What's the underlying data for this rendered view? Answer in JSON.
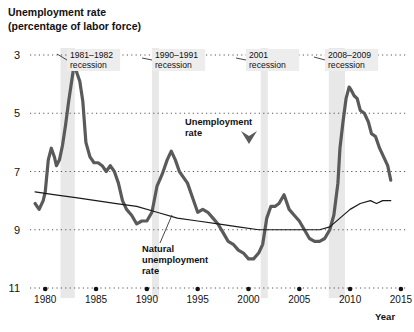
{
  "chart_data": {
    "type": "line",
    "title": "Unemployment rate",
    "subtitle": "(percentage of labor force)",
    "xlabel": "Year",
    "ylabel": "",
    "xlim": [
      1978.5,
      2015.5
    ],
    "ylim": [
      3,
      11
    ],
    "yticks": [
      3,
      5,
      7,
      9,
      11
    ],
    "xticks": [
      1980,
      1985,
      1990,
      1995,
      2000,
      2005,
      2010,
      2015
    ],
    "grid": "dotted-horizontal",
    "legend_position": "inline-annotations",
    "series": [
      {
        "name": "Unemployment rate",
        "color": "#5a5a5a",
        "width": 3.2,
        "points": [
          [
            1979.0,
            5.9
          ],
          [
            1979.4,
            5.7
          ],
          [
            1979.8,
            6.0
          ],
          [
            1980.0,
            6.3
          ],
          [
            1980.3,
            7.4
          ],
          [
            1980.6,
            7.8
          ],
          [
            1980.9,
            7.5
          ],
          [
            1981.1,
            7.2
          ],
          [
            1981.4,
            7.4
          ],
          [
            1981.7,
            7.9
          ],
          [
            1982.0,
            8.6
          ],
          [
            1982.3,
            9.4
          ],
          [
            1982.6,
            10.1
          ],
          [
            1982.9,
            10.8
          ],
          [
            1983.1,
            10.4
          ],
          [
            1983.4,
            10.1
          ],
          [
            1983.7,
            9.4
          ],
          [
            1984.0,
            8.0
          ],
          [
            1984.4,
            7.5
          ],
          [
            1984.8,
            7.3
          ],
          [
            1985.2,
            7.3
          ],
          [
            1985.6,
            7.2
          ],
          [
            1986.0,
            7.0
          ],
          [
            1986.4,
            7.2
          ],
          [
            1986.8,
            7.0
          ],
          [
            1987.2,
            6.6
          ],
          [
            1987.6,
            6.0
          ],
          [
            1988.0,
            5.7
          ],
          [
            1988.5,
            5.5
          ],
          [
            1989.0,
            5.2
          ],
          [
            1989.5,
            5.3
          ],
          [
            1990.0,
            5.3
          ],
          [
            1990.5,
            5.6
          ],
          [
            1991.0,
            6.5
          ],
          [
            1991.5,
            6.9
          ],
          [
            1992.0,
            7.4
          ],
          [
            1992.4,
            7.7
          ],
          [
            1992.8,
            7.4
          ],
          [
            1993.2,
            7.0
          ],
          [
            1993.6,
            6.8
          ],
          [
            1994.0,
            6.6
          ],
          [
            1994.5,
            6.1
          ],
          [
            1995.0,
            5.6
          ],
          [
            1995.5,
            5.7
          ],
          [
            1996.0,
            5.6
          ],
          [
            1996.5,
            5.4
          ],
          [
            1997.0,
            5.2
          ],
          [
            1997.5,
            4.9
          ],
          [
            1998.0,
            4.6
          ],
          [
            1998.5,
            4.5
          ],
          [
            1999.0,
            4.3
          ],
          [
            1999.5,
            4.2
          ],
          [
            2000.0,
            4.0
          ],
          [
            2000.5,
            4.0
          ],
          [
            2001.0,
            4.2
          ],
          [
            2001.4,
            4.5
          ],
          [
            2001.8,
            5.4
          ],
          [
            2002.2,
            5.8
          ],
          [
            2002.6,
            5.8
          ],
          [
            2003.0,
            5.9
          ],
          [
            2003.5,
            6.2
          ],
          [
            2004.0,
            5.7
          ],
          [
            2004.5,
            5.5
          ],
          [
            2005.0,
            5.3
          ],
          [
            2005.5,
            5.0
          ],
          [
            2006.0,
            4.7
          ],
          [
            2006.5,
            4.6
          ],
          [
            2007.0,
            4.6
          ],
          [
            2007.5,
            4.7
          ],
          [
            2008.0,
            5.0
          ],
          [
            2008.4,
            5.5
          ],
          [
            2008.8,
            6.6
          ],
          [
            2009.0,
            7.8
          ],
          [
            2009.3,
            8.7
          ],
          [
            2009.6,
            9.5
          ],
          [
            2009.9,
            9.9
          ],
          [
            2010.1,
            9.8
          ],
          [
            2010.4,
            9.6
          ],
          [
            2010.7,
            9.5
          ],
          [
            2011.0,
            9.1
          ],
          [
            2011.4,
            9.0
          ],
          [
            2011.8,
            8.7
          ],
          [
            2012.1,
            8.3
          ],
          [
            2012.5,
            8.2
          ],
          [
            2012.9,
            7.8
          ],
          [
            2013.3,
            7.5
          ],
          [
            2013.7,
            7.2
          ],
          [
            2014.0,
            6.7
          ]
        ]
      },
      {
        "name": "Natural unemployment rate",
        "color": "#1a1a1a",
        "width": 1.2,
        "points": [
          [
            1979.0,
            6.3
          ],
          [
            1981.0,
            6.2
          ],
          [
            1983.0,
            6.1
          ],
          [
            1985.0,
            6.0
          ],
          [
            1987.0,
            5.9
          ],
          [
            1989.0,
            5.8
          ],
          [
            1991.0,
            5.6
          ],
          [
            1993.0,
            5.4
          ],
          [
            1995.0,
            5.3
          ],
          [
            1997.0,
            5.2
          ],
          [
            1999.0,
            5.1
          ],
          [
            2001.0,
            5.0
          ],
          [
            2003.0,
            5.0
          ],
          [
            2005.0,
            5.0
          ],
          [
            2007.0,
            5.0
          ],
          [
            2008.0,
            5.1
          ],
          [
            2009.0,
            5.4
          ],
          [
            2010.0,
            5.7
          ],
          [
            2011.0,
            5.9
          ],
          [
            2012.0,
            6.0
          ],
          [
            2012.6,
            5.9
          ],
          [
            2013.2,
            6.0
          ],
          [
            2014.0,
            6.0
          ]
        ]
      }
    ],
    "recession_bands": [
      {
        "label": "1981–1982 recession",
        "start": 1981.5,
        "end": 1982.9
      },
      {
        "label": "1990–1991 recession",
        "start": 1990.5,
        "end": 1991.2
      },
      {
        "label": "2001 recession",
        "start": 2001.2,
        "end": 2001.9
      },
      {
        "label": "2008–2009 recession",
        "start": 2007.9,
        "end": 2009.5
      }
    ],
    "band_color": "#e8e8e8",
    "annotations": [
      {
        "name": "recession-1981-1982",
        "line1": "1981–1982",
        "line2": "recession",
        "x": 70,
        "y": 58,
        "leader_x1": 67,
        "leader_y1": 60,
        "leader_x2": 57,
        "leader_y2": 54
      },
      {
        "name": "recession-1990-1991",
        "line1": "1990–1991",
        "line2": "recession",
        "x": 155,
        "y": 58,
        "leader_x1": 152,
        "leader_y1": 60,
        "leader_x2": 142,
        "leader_y2": 58
      },
      {
        "name": "recession-2001",
        "line1": "2001",
        "line2": "recession",
        "x": 249,
        "y": 58,
        "leader_x1": 246,
        "leader_y1": 60,
        "leader_x2": 236,
        "leader_y2": 58
      },
      {
        "name": "recession-2008-2009",
        "line1": "2008–2009",
        "line2": "recession",
        "x": 328,
        "y": 58,
        "leader_x1": 325,
        "leader_y1": 60,
        "leader_x2": 314,
        "leader_y2": 57
      }
    ],
    "series_labels": [
      {
        "name": "unemployment-rate-label",
        "line1": "Unemployment",
        "line2": "rate",
        "x": 185,
        "y": 125
      },
      {
        "name": "natural-unemployment-rate-label",
        "line1": "Natural",
        "line2": "unemployment",
        "line3": "rate",
        "x": 142,
        "y": 252
      }
    ]
  },
  "axis": {
    "y_labels": [
      "11",
      "9",
      "7",
      "5",
      "3"
    ],
    "x_labels": [
      "1980",
      "1985",
      "1990",
      "1995",
      "2000",
      "2005",
      "2010",
      "2015"
    ],
    "x_axis_name": "Year"
  }
}
